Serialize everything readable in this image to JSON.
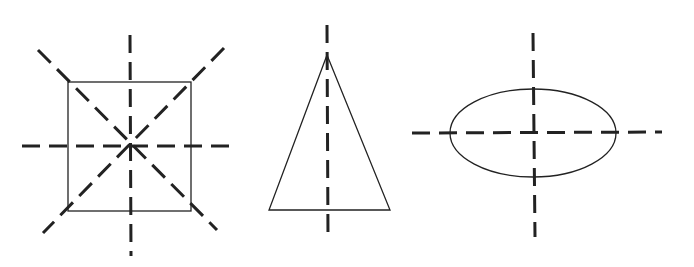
{
  "diagram": {
    "title": "",
    "figures": [
      {
        "id": "square",
        "shape": "square",
        "symmetry_axes": 4,
        "axes": [
          "vertical",
          "horizontal",
          "diagonal-1",
          "diagonal-2"
        ]
      },
      {
        "id": "triangle",
        "shape": "isosceles-triangle",
        "symmetry_axes": 1,
        "axes": [
          "vertical"
        ]
      },
      {
        "id": "ellipse",
        "shape": "ellipse",
        "symmetry_axes": 2,
        "axes": [
          "vertical",
          "horizontal"
        ]
      }
    ],
    "colors": {
      "line": "#222222",
      "background": "#ffffff"
    }
  }
}
